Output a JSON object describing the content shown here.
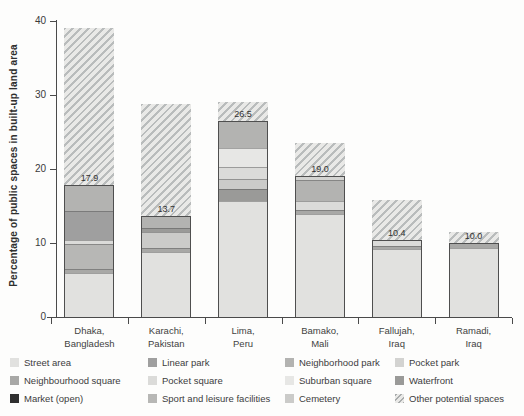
{
  "figure": {
    "background": "#fdfdfc",
    "axis_color": "#4a4a4a",
    "text_color": "#3c3c3c"
  },
  "chart_data": {
    "type": "bar",
    "stacked": true,
    "title": "",
    "xlabel": "",
    "ylabel": "Percentage of public spaces in built-up land area",
    "ylim": [
      0,
      40
    ],
    "yticks": [
      0,
      10,
      20,
      30,
      40
    ],
    "grid": false,
    "legend_position": "bottom",
    "hatch": {
      "stripe": "#b9bcbc",
      "bg": "#e9e9e7"
    },
    "palette": {
      "street_area": "#e1e1df",
      "linear_park": "#9f9f9f",
      "neighborhood_park": "#b3b3b1",
      "pocket_park": "#d3d3d1",
      "neighbourhood_square": "#a8a8a6",
      "pocket_square": "#dbdbd9",
      "suburban_square": "#e7e7e5",
      "waterfront": "#9a9a98",
      "market_open": "#2f2f2f",
      "sport_leisure": "#b7b7b5",
      "cemetery": "#cbcbc9"
    },
    "bars": [
      {
        "city_line1": "Dhaka,",
        "city_line2": "Bangladesh",
        "public_space_pct": 17.9,
        "value_label": "17.9",
        "total_with_potential_pct": 39.0,
        "segments": [
          {
            "key": "street_area",
            "value": 6.0
          },
          {
            "key": "neighbourhood_square",
            "value": 0.6
          },
          {
            "key": "sport_leisure",
            "value": 3.4
          },
          {
            "key": "pocket_square",
            "value": 0.5
          },
          {
            "key": "linear_park",
            "value": 3.9
          },
          {
            "key": "neighborhood_park",
            "value": 3.5
          }
        ]
      },
      {
        "city_line1": "Karachi,",
        "city_line2": "Pakistan",
        "public_space_pct": 13.7,
        "value_label": "13.7",
        "total_with_potential_pct": 28.8,
        "segments": [
          {
            "key": "street_area",
            "value": 8.9
          },
          {
            "key": "neighbourhood_square",
            "value": 0.5
          },
          {
            "key": "cemetery",
            "value": 2.2
          },
          {
            "key": "waterfront",
            "value": 0.5
          },
          {
            "key": "neighborhood_park",
            "value": 1.6
          }
        ]
      },
      {
        "city_line1": "Lima,",
        "city_line2": "Peru",
        "public_space_pct": 26.5,
        "value_label": "26.5",
        "total_with_potential_pct": 29.0,
        "segments": [
          {
            "key": "street_area",
            "value": 15.8
          },
          {
            "key": "waterfront",
            "value": 1.6
          },
          {
            "key": "cemetery",
            "value": 1.4
          },
          {
            "key": "pocket_square",
            "value": 1.6
          },
          {
            "key": "suburban_square",
            "value": 2.5
          },
          {
            "key": "neighborhood_park",
            "value": 3.6
          }
        ]
      },
      {
        "city_line1": "Bamako,",
        "city_line2": "Mali",
        "public_space_pct": 19.0,
        "value_label": "19.0",
        "total_with_potential_pct": 23.5,
        "segments": [
          {
            "key": "street_area",
            "value": 14.0
          },
          {
            "key": "neighbourhood_square",
            "value": 0.5
          },
          {
            "key": "pocket_square",
            "value": 1.3
          },
          {
            "key": "neighborhood_park",
            "value": 2.8
          },
          {
            "key": "pocket_park",
            "value": 0.4
          }
        ]
      },
      {
        "city_line1": "Fallujah,",
        "city_line2": "Iraq",
        "public_space_pct": 10.4,
        "value_label": "10.4",
        "total_with_potential_pct": 15.8,
        "segments": [
          {
            "key": "street_area",
            "value": 9.3
          },
          {
            "key": "neighbourhood_square",
            "value": 0.4
          },
          {
            "key": "pocket_square",
            "value": 0.7
          }
        ]
      },
      {
        "city_line1": "Ramadi,",
        "city_line2": "Iraq",
        "public_space_pct": 10.0,
        "value_label": "10.0",
        "total_with_potential_pct": 11.5,
        "segments": [
          {
            "key": "street_area",
            "value": 9.5
          },
          {
            "key": "neighbourhood_square",
            "value": 0.5
          }
        ]
      }
    ],
    "legend_columns": [
      [
        {
          "key": "street_area",
          "label": "Street area"
        },
        {
          "key": "neighbourhood_square",
          "label": "Neighbourhood square"
        },
        {
          "key": "market_open",
          "label": "Market (open)"
        }
      ],
      [
        {
          "key": "linear_park",
          "label": "Linear park"
        },
        {
          "key": "pocket_square",
          "label": "Pocket square"
        },
        {
          "key": "sport_leisure",
          "label": "Sport and leisure facilities"
        }
      ],
      [
        {
          "key": "neighborhood_park",
          "label": "Neighborhood park"
        },
        {
          "key": "suburban_square",
          "label": "Suburban square"
        },
        {
          "key": "cemetery",
          "label": "Cemetery"
        }
      ],
      [
        {
          "key": "pocket_park",
          "label": "Pocket park"
        },
        {
          "key": "waterfront",
          "label": "Waterfront"
        },
        {
          "key": "other_potential",
          "label": "Other potential spaces"
        }
      ]
    ]
  }
}
